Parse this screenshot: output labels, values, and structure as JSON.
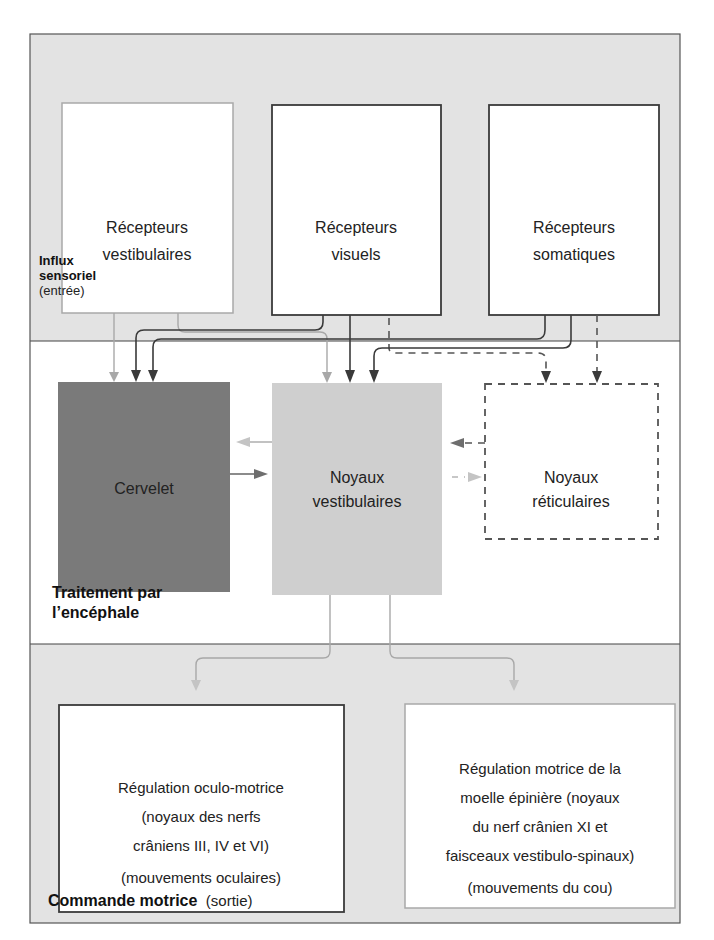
{
  "sections": {
    "input": {
      "title_bold_line1": "Influx",
      "title_bold_line2": "sensoriel",
      "title_normal": "(entrée)"
    },
    "processing": {
      "title_line1": "Traitement par",
      "title_line2": "l’encéphale"
    },
    "output": {
      "title_bold": "Commande motrice",
      "title_normal": "(sortie)"
    }
  },
  "receptors": [
    {
      "id": "vestibulaires",
      "line1": "Récepteurs",
      "line2": "vestibulaires"
    },
    {
      "id": "visuels",
      "line1": "Récepteurs",
      "line2": "visuels"
    },
    {
      "id": "somatiques",
      "line1": "Récepteurs",
      "line2": "somatiques"
    }
  ],
  "processing_nodes": {
    "cervelet": {
      "label": "Cervelet"
    },
    "noyaux_vestibulaires": {
      "line1": "Noyaux",
      "line2": "vestibulaires"
    },
    "noyaux_reticulaires": {
      "line1": "Noyaux",
      "line2": "réticulaires"
    }
  },
  "outputs": [
    {
      "id": "oculo",
      "lines": [
        "Régulation oculo-motrice",
        "(noyaux des nerfs",
        "crâniens III, IV et VI)",
        "(mouvements oculaires)"
      ]
    },
    {
      "id": "spinal",
      "lines": [
        "Régulation motrice de la",
        "moelle épinière (noyaux",
        "du nerf crânien XI et",
        "faisceaux vestibulo-spinaux)",
        "(mouvements du cou)"
      ]
    }
  ],
  "connections": [
    {
      "from": "Récepteurs vestibulaires",
      "to": "Cervelet",
      "style": "solid-light"
    },
    {
      "from": "Récepteurs vestibulaires",
      "to": "Noyaux vestibulaires",
      "style": "solid-light"
    },
    {
      "from": "Récepteurs visuels",
      "to": "Cervelet",
      "style": "solid-dark"
    },
    {
      "from": "Récepteurs visuels",
      "to": "Noyaux vestibulaires",
      "style": "solid-dark"
    },
    {
      "from": "Récepteurs visuels",
      "to": "Noyaux réticulaires",
      "style": "dashed"
    },
    {
      "from": "Récepteurs somatiques",
      "to": "Cervelet",
      "style": "solid-dark"
    },
    {
      "from": "Récepteurs somatiques",
      "to": "Noyaux vestibulaires",
      "style": "solid-dark"
    },
    {
      "from": "Récepteurs somatiques",
      "to": "Noyaux réticulaires",
      "style": "dashed"
    },
    {
      "from": "Noyaux vestibulaires",
      "to": "Cervelet",
      "style": "solid-light"
    },
    {
      "from": "Cervelet",
      "to": "Noyaux vestibulaires",
      "style": "solid-mid"
    },
    {
      "from": "Noyaux réticulaires",
      "to": "Noyaux vestibulaires",
      "style": "dashed-dark"
    },
    {
      "from": "Noyaux vestibulaires",
      "to": "Noyaux réticulaires",
      "style": "dashed-light"
    },
    {
      "from": "Noyaux vestibulaires",
      "to": "Régulation oculo-motrice",
      "style": "solid-light"
    },
    {
      "from": "Noyaux vestibulaires",
      "to": "Régulation motrice de la moelle épinière",
      "style": "solid-light"
    }
  ]
}
